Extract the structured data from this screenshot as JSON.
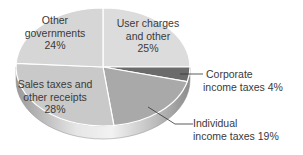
{
  "chart_data": {
    "type": "pie",
    "style": "3d",
    "title": "",
    "start_angle_deg": 0,
    "direction": "clockwise",
    "slices": [
      {
        "label": "User charges and other",
        "value": 25,
        "color": "#dcdcdc",
        "lines": [
          "User charges",
          "and other",
          "25%"
        ]
      },
      {
        "label": "Corporate income taxes",
        "value": 4,
        "color": "#6b6b6b",
        "lines": [
          "Corporate",
          "income taxes  4%"
        ]
      },
      {
        "label": "Individual income taxes",
        "value": 19,
        "color": "#a9a9a9",
        "lines": [
          "Individual",
          "income taxes  19%"
        ]
      },
      {
        "label": "Sales taxes and other receipts",
        "value": 28,
        "color": "#c9c9c9",
        "lines": [
          "Sales taxes and",
          "other receipts",
          "28%"
        ]
      },
      {
        "label": "Other governments",
        "value": 24,
        "color": "#d6d6d6",
        "lines": [
          "Other",
          "governments",
          "24%"
        ]
      }
    ],
    "units": "%"
  }
}
